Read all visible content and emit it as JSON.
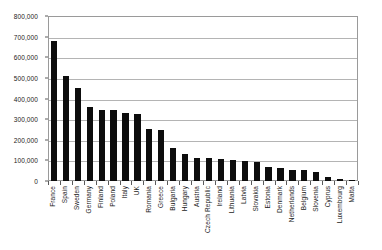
{
  "chart_data": {
    "type": "bar",
    "title": "",
    "xlabel": "",
    "ylabel": "",
    "ylim": [
      0,
      800000
    ],
    "grid": true,
    "legend": "none",
    "orientation": "vertical",
    "bar_color": "#0d0d0d",
    "y_ticks": [
      "0",
      "100,000",
      "200,000",
      "300,000",
      "400,000",
      "500,000",
      "600,000",
      "700,000",
      "800,000"
    ],
    "y_tick_values": [
      0,
      100000,
      200000,
      300000,
      400000,
      500000,
      600000,
      700000,
      800000
    ],
    "categories": [
      "France",
      "Spain",
      "Sweden",
      "Germany",
      "Finland",
      "Poland",
      "Italy",
      "UK",
      "Romania",
      "Greece",
      "Bulgaria",
      "Hungary",
      "Austria",
      "Czech Republic",
      "Ireland",
      "Lithuania",
      "Latvia",
      "Slovakia",
      "Estonia",
      "Denmark",
      "Netherlands",
      "Belgium",
      "Slovenia",
      "Cyprus",
      "Luxembourg",
      "Malta"
    ],
    "values": [
      680000,
      510000,
      452000,
      360000,
      345000,
      343000,
      330000,
      325000,
      250000,
      245000,
      160000,
      130000,
      112000,
      110000,
      105000,
      100000,
      98000,
      90000,
      70000,
      65000,
      55000,
      52000,
      42000,
      20000,
      10000,
      4000
    ]
  }
}
